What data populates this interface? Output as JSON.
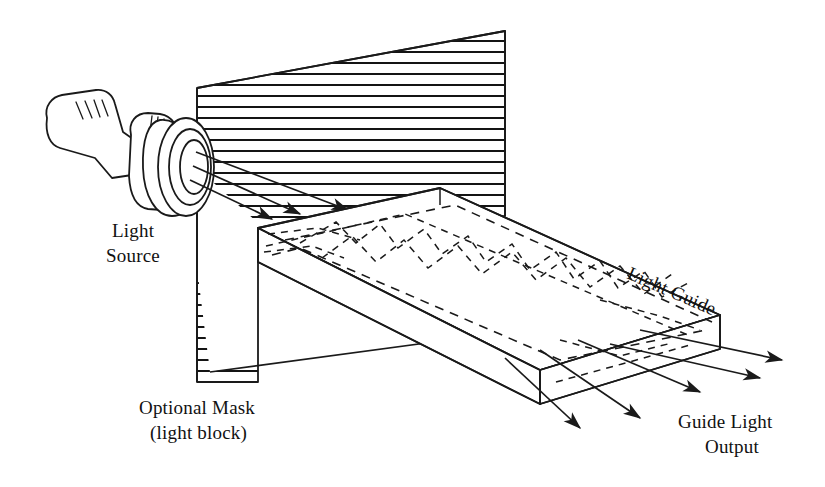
{
  "figure": {
    "background_color": "#ffffff",
    "ink_color": "#1a1a1a"
  },
  "labels": {
    "light_source_line1": "Light",
    "light_source_line2": "Source",
    "optional_mask_line1": "Optional Mask",
    "optional_mask_line2": "(light block)",
    "light_guide": "Light Guide",
    "guide_output_line1": "Guide Light",
    "guide_output_line2": "Output"
  },
  "components": [
    {
      "name": "light-source",
      "kind": "flashlight",
      "description": "Hand flashlight with ribbed grip and concentric lens bezel rings aimed right at the mask aperture",
      "label": "Light Source",
      "grip_marks": 4,
      "bezel_rings": 3
    },
    {
      "name": "optional-mask",
      "kind": "hatched-panel",
      "description": "Horizontally hatched opaque panel that blocks light except through a triangular aperture",
      "label": "Optional Mask (light block)",
      "hatch_orientation": "horizontal",
      "hatch_spacing_px": 11,
      "hatch_line_count": 33,
      "aperture_shape": "triangular cone opening toward the light guide"
    },
    {
      "name": "light-guide",
      "kind": "rectangular-slab",
      "description": "Transparent rectangular slab shown in isometric projection carrying light by total internal reflection",
      "label": "Light Guide",
      "internal_ray_style": "dashed zigzag",
      "internal_ray_count": 3
    },
    {
      "name": "guide-light-output",
      "kind": "arrow-bundle",
      "description": "Five arrows radiating from the far end face of the light guide",
      "label": "Guide Light Output",
      "arrow_count": 5
    },
    {
      "name": "input-rays",
      "kind": "arrow-bundle",
      "description": "Three straight arrows travelling from the flashlight lens through the mask aperture onto the guide input face",
      "arrow_count": 3
    }
  ],
  "geometry": {
    "mask_polygon": "197,88 505,31 505,216 258,228 258,382 197,382",
    "guide_top_face": "258,228 440,188 720,315 540,370",
    "guide_front_face": "258,228 258,262 540,404 540,370",
    "guide_end_face": "540,370 540,404 720,349 720,315"
  }
}
